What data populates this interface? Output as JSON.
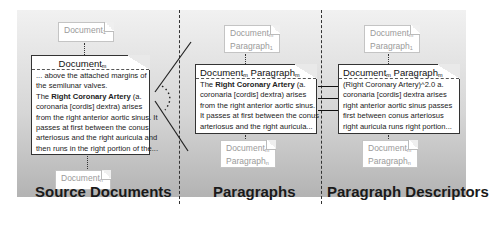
{
  "panels": {
    "source": {
      "label": "Source Documents",
      "doc_top": {
        "name": "Document",
        "sub": "1"
      },
      "doc_main": {
        "name": "Document",
        "sub": "m",
        "lines": [
          "... above the attached margins of",
          "the semilunar valves.",
          "The |Right Coronary Artery| (a.",
          "coronaria [cordis] dextra) arises",
          "from the right anterior aortic sinus. It",
          "passes at first between the conus",
          "arteriosus and the right auricula and",
          "then runs in the right portion of the..."
        ],
        "line_1": "... above the attached margins of",
        "line_2": "the semilunar valves.",
        "line_3_pre": "The ",
        "line_3_bold": "Right Coronary Artery",
        "line_3_post": " (a.",
        "line_4": "coronaria [cordis] dextra) arises",
        "line_5": "from the right anterior aortic sinus. It",
        "line_6": "passes at first between the conus",
        "line_7": "arteriosus and the right auricula and",
        "line_8": "then runs in the right portion of the..."
      },
      "doc_bottom": {
        "name": "Document",
        "sub": "n"
      }
    },
    "paragraphs": {
      "label": "Paragraphs",
      "doc_top": {
        "name": "Document",
        "name_sub": "m",
        "para": "Paragraph",
        "para_sub": "1"
      },
      "doc_main": {
        "name": "Document",
        "name_sub": "m",
        "para": "Paragraph",
        "para_sub": "m",
        "line_1_pre": "The ",
        "line_1_bold": "Right Coronary Artery",
        "line_1_post": " (a.",
        "line_2": "coronaria [cordis] dextra) arises",
        "line_3": "from the right anterior aortic sinus.",
        "line_4": "It passes at first between the conus",
        "line_5": "arteriosus and the right auricula..."
      },
      "doc_bottom": {
        "name": "Document",
        "name_sub": "m",
        "para": "Paragraph",
        "para_sub": "n"
      }
    },
    "descriptors": {
      "label": "Paragraph Descriptors",
      "doc_top": {
        "name": "Document",
        "name_sub": "m",
        "para": "Paragraph",
        "para_sub": "1"
      },
      "doc_main": {
        "name": "Document",
        "name_sub": "m",
        "para": "Paragraph",
        "para_sub": "m",
        "line_1": "(Right Coronary Artery)^2.0 a.",
        "line_2": "coronaria [cordis] dextra arises",
        "line_3": "right anterior aortic sinus passes",
        "line_4": "first between conus arteriosus",
        "line_5": "right auricula runs right portion..."
      },
      "doc_bottom": {
        "name": "Document",
        "name_sub": "m",
        "para": "Paragraph",
        "para_sub": "n"
      }
    }
  },
  "colors": {
    "panel_top": "#f1f1f1",
    "panel_bottom": "#b3b3b3",
    "ink": "#1a1a1a",
    "faded_text": "#9a9a9a"
  }
}
